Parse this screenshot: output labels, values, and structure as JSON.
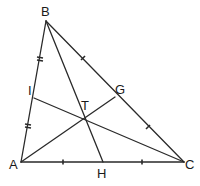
{
  "diagram": {
    "type": "triangle-cevians",
    "points": {
      "A": {
        "label": "A",
        "x": 21,
        "y": 162,
        "label_x": 9,
        "label_y": 169
      },
      "B": {
        "label": "B",
        "x": 46,
        "y": 21,
        "label_x": 41,
        "label_y": 16
      },
      "C": {
        "label": "C",
        "x": 184,
        "y": 162,
        "label_x": 185,
        "label_y": 169
      },
      "G": {
        "label": "G",
        "x": 115,
        "y": 97,
        "label_x": 115,
        "label_y": 94
      },
      "H": {
        "label": "H",
        "x": 103,
        "y": 162,
        "label_x": 97,
        "label_y": 178
      },
      "I": {
        "label": "I",
        "x": 34,
        "y": 98,
        "label_x": 28,
        "label_y": 95
      },
      "T": {
        "label": "T",
        "x": 85,
        "y": 116,
        "label_x": 81,
        "label_y": 110
      }
    },
    "segments": [
      {
        "from": "A",
        "to": "B"
      },
      {
        "from": "B",
        "to": "C"
      },
      {
        "from": "C",
        "to": "A"
      },
      {
        "from": "A",
        "to": "G"
      },
      {
        "from": "B",
        "to": "H"
      },
      {
        "from": "C",
        "to": "I"
      }
    ],
    "tick_marks": [
      {
        "side": "AB",
        "segment": "BI",
        "style": "double",
        "x": 40,
        "y": 58
      },
      {
        "side": "AB",
        "segment": "IA",
        "style": "double",
        "x": 28,
        "y": 126
      },
      {
        "side": "BC",
        "segment": "BG",
        "style": "single",
        "x": 83,
        "y": 58
      },
      {
        "side": "BC",
        "segment": "GC",
        "style": "single",
        "x": 148,
        "y": 127
      },
      {
        "side": "AC",
        "segment": "AH",
        "style": "single",
        "x": 63,
        "y": 162
      },
      {
        "side": "AC",
        "segment": "HC",
        "style": "single",
        "x": 142,
        "y": 162
      }
    ],
    "colors": {
      "line": "#2a2a2a",
      "label": "#1a1a1a",
      "background": "#ffffff"
    }
  }
}
